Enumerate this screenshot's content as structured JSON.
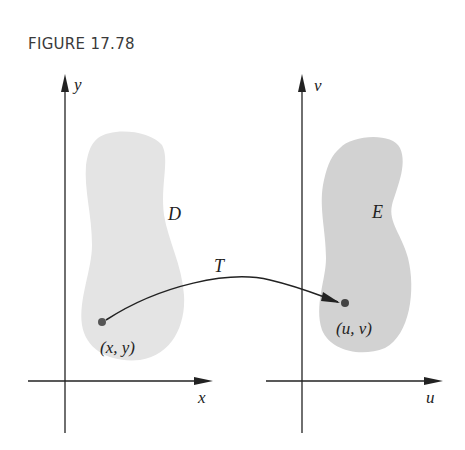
{
  "figure": {
    "title": "FIGURE 17.78"
  },
  "left_plane": {
    "x_axis_label": "x",
    "y_axis_label": "y",
    "region_label": "D",
    "point_label": "(x, y)",
    "region_color": "#e4e4e4"
  },
  "right_plane": {
    "x_axis_label": "u",
    "y_axis_label": "v",
    "region_label": "E",
    "point_label": "(u, v)",
    "region_color": "#d2d2d2"
  },
  "transformation": {
    "label": "T"
  },
  "colors": {
    "axis": "#222222",
    "point": "#555555"
  }
}
